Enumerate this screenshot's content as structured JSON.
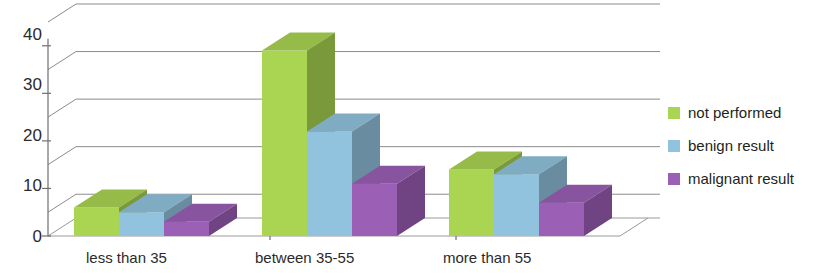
{
  "chart_data": {
    "type": "bar",
    "title": "",
    "subtitle": "",
    "xlabel": "",
    "ylabel": "",
    "categories": [
      "less than 35",
      "between 35-55",
      "more than 55"
    ],
    "series": [
      {
        "name": "not performed",
        "color": "#AAD552",
        "values": [
          6,
          39,
          14
        ]
      },
      {
        "name": "benign result",
        "color": "#92C3DE",
        "values": [
          5,
          22,
          13
        ]
      },
      {
        "name": "malignant result",
        "color": "#9B5FB5",
        "values": [
          3,
          11,
          7
        ]
      }
    ],
    "ylim": [
      0,
      45
    ],
    "yticks": [
      0,
      10,
      20,
      30,
      40
    ],
    "ytick_labels": [
      "0",
      "10",
      "20",
      "30",
      "40"
    ],
    "gridlines": [
      5,
      15,
      25,
      35,
      45
    ],
    "grid": true,
    "legend_position": "right",
    "style": "3d-clustered-column"
  },
  "axis": {
    "ytick_labels": [
      "40",
      "30",
      "20",
      "10",
      "0"
    ]
  },
  "legend": {
    "items": [
      {
        "label": "not performed",
        "color": "#AAD552"
      },
      {
        "label": "benign result",
        "color": "#92C3DE"
      },
      {
        "label": "malignant result",
        "color": "#9B5FB5"
      }
    ]
  }
}
